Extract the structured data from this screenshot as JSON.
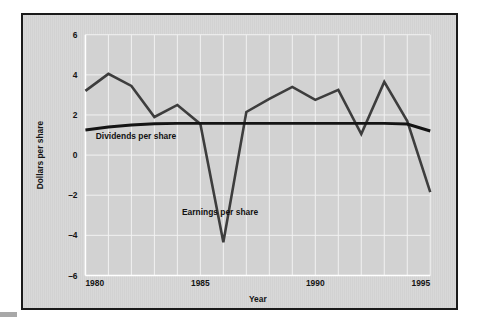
{
  "figure": {
    "background_color": "#d6d6d6",
    "frame_color": "#1b1b1b",
    "plot_background_color": "#d2d2d2",
    "gridline_color": "#f2f2f2"
  },
  "chart_data": {
    "type": "line",
    "title": "",
    "xlabel": "Year",
    "ylabel": "Dollars per share",
    "xlim": [
      1980,
      1995
    ],
    "ylim": [
      -6,
      6
    ],
    "xticks": [
      1980,
      1985,
      1990,
      1995
    ],
    "xtick_labels": [
      "1980",
      "1985",
      "1990",
      "1995"
    ],
    "yticks": [
      6,
      4,
      2,
      0,
      -2,
      -4,
      -6
    ],
    "ytick_labels": [
      "6",
      "4",
      "2",
      "0",
      "–2",
      "–4",
      "–6"
    ],
    "grid": true,
    "grid_axis": "both",
    "legend_position": "inline-annotations",
    "x": [
      1980,
      1981,
      1982,
      1983,
      1984,
      1985,
      1986,
      1987,
      1988,
      1989,
      1990,
      1991,
      1992,
      1993,
      1994,
      1995
    ],
    "series": [
      {
        "name": "Earnings per share",
        "color": "#3d3d3d",
        "line_width": 2.6,
        "values": [
          3.2,
          4.05,
          3.45,
          1.9,
          2.5,
          1.55,
          -4.35,
          2.15,
          2.8,
          3.4,
          2.75,
          3.25,
          1.05,
          3.65,
          1.7,
          -1.85
        ],
        "annotation_label": "Earnings per share",
        "annotation_x": 1984.2,
        "annotation_y": -3.0
      },
      {
        "name": "Dividends per share",
        "color": "#141414",
        "line_width": 3.0,
        "values": [
          1.25,
          1.4,
          1.5,
          1.56,
          1.58,
          1.58,
          1.58,
          1.58,
          1.58,
          1.58,
          1.58,
          1.58,
          1.58,
          1.58,
          1.55,
          1.2
        ],
        "annotation_label": "Dividends per share",
        "annotation_x": 1980.45,
        "annotation_y": 0.82
      }
    ]
  }
}
